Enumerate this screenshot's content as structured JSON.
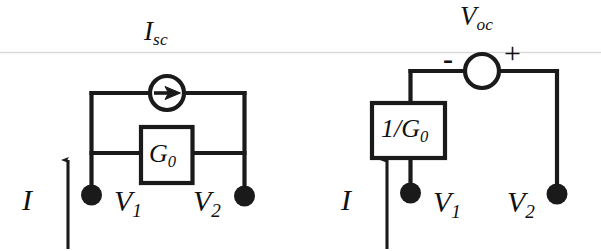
{
  "figure": {
    "name": "equivalent-circuit-pair",
    "background_color": "#ffffff",
    "stroke_color": "#1a1a1a",
    "scan_line_color": "#d8d8d8",
    "width": 601,
    "height": 251
  },
  "norton": {
    "title": "Norton equivalent circuit",
    "current_source": {
      "label_main": "I",
      "label_sub": "sc",
      "symbol": "current-source-circle-with-arrow",
      "arrow_direction": "right"
    },
    "conductance_box": {
      "label_main": "G",
      "label_sub": "0",
      "symbol": "resistor-box"
    },
    "input_current": {
      "label": "I",
      "arrow_direction": "up"
    },
    "terminals": [
      {
        "label_main": "V",
        "label_sub": "1",
        "dot": "filled",
        "label_side": "right"
      },
      {
        "label_main": "V",
        "label_sub": "2",
        "dot": "filled",
        "label_side": "left"
      }
    ]
  },
  "thevenin": {
    "title": "Thevenin equivalent circuit",
    "voltage_source": {
      "label_main": "V",
      "label_sub": "oc",
      "symbol": "voltage-source-circle",
      "minus_sign": "-",
      "plus_sign": "+",
      "minus_side": "left",
      "plus_side": "right"
    },
    "resistance_box": {
      "label_main": "1/G",
      "label_sub": "0",
      "symbol": "resistor-box"
    },
    "input_current": {
      "label": "I",
      "arrow_direction": "up"
    },
    "terminals": [
      {
        "label_main": "V",
        "label_sub": "1",
        "dot": "filled",
        "label_side": "right"
      },
      {
        "label_main": "V",
        "label_sub": "2",
        "dot": "filled",
        "label_side": "left"
      }
    ]
  }
}
